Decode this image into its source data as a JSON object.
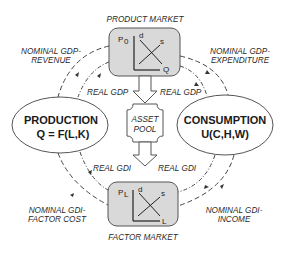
{
  "product_market": {
    "title": "PRODUCT MARKET",
    "y_axis": "P",
    "y_sub": "0",
    "x_axis": "Q",
    "demand": "d",
    "supply": "s"
  },
  "factor_market": {
    "title": "FACTOR MARKET",
    "y_axis": "P",
    "y_sub": "L",
    "x_axis": "L",
    "demand": "d",
    "supply": "s"
  },
  "production": {
    "title": "PRODUCTION",
    "formula": "Q = F(L,K)"
  },
  "consumption": {
    "title": "CONSUMPTION",
    "formula": "U(C,H,W)"
  },
  "asset_pool": {
    "line1": "ASSET",
    "line2": "POOL"
  },
  "flows": {
    "nominal_gdp_revenue": [
      "NOMINAL GDP-",
      "REVENUE"
    ],
    "nominal_gdp_expenditure": [
      "NOMINAL GDP-",
      "EXPENDITURE"
    ],
    "real_gdp_left": "REAL GDP",
    "real_gdp_right": "REAL GDP",
    "real_gdi_left": "REAL GDI",
    "real_gdi_right": "REAL GDI",
    "nominal_gdi_factor_cost": [
      "NOMINAL GDI-",
      "FACTOR COST"
    ],
    "nominal_gdi_income": [
      "NOMINAL GDI-",
      "INCOME"
    ]
  },
  "colors": {
    "box_fill": "#d9d9d9",
    "stroke": "#444444",
    "text": "#222222"
  }
}
